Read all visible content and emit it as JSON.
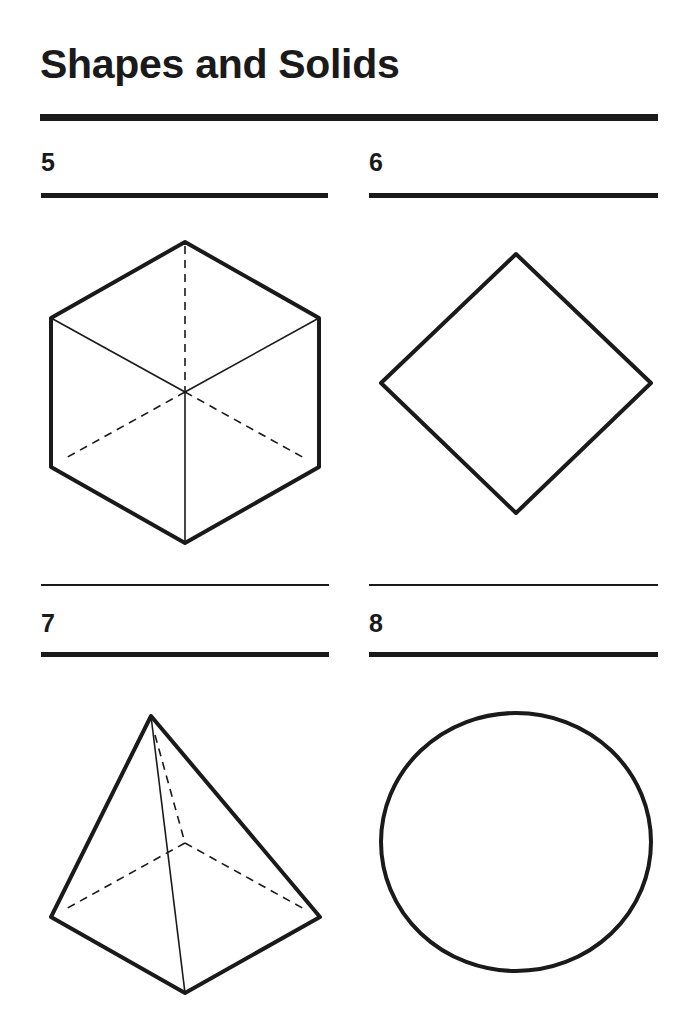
{
  "page": {
    "title": "Shapes and Solids"
  },
  "items": [
    {
      "number": "5",
      "shape": "cube"
    },
    {
      "number": "6",
      "shape": "square"
    },
    {
      "number": "7",
      "shape": "square-pyramid"
    },
    {
      "number": "8",
      "shape": "circle"
    }
  ]
}
